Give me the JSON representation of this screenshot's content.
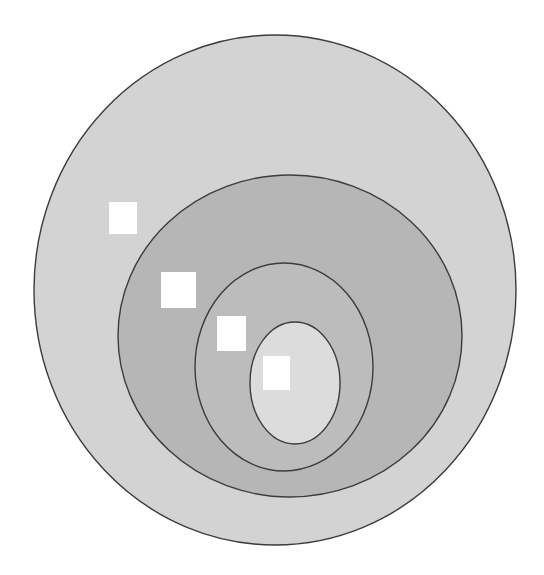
{
  "diagram": {
    "type": "nested-ellipses",
    "background": "#ffffff",
    "stroke_color": "#3c3c3c",
    "layers": [
      {
        "name": "outer-ellipse",
        "cx": 275,
        "cy": 290,
        "rx": 241,
        "ry": 255,
        "fill": "#d3d3d3"
      },
      {
        "name": "second-ellipse",
        "cx": 290,
        "cy": 336,
        "rx": 172,
        "ry": 161,
        "fill": "#b6b6b6"
      },
      {
        "name": "third-ellipse",
        "cx": 284,
        "cy": 367,
        "rx": 89,
        "ry": 104,
        "fill": "#bcbcbc"
      },
      {
        "name": "inner-ellipse",
        "cx": 295,
        "cy": 383,
        "rx": 45,
        "ry": 61,
        "fill": "#dcdcdc"
      }
    ],
    "markers": [
      {
        "name": "marker-outer",
        "x": 109,
        "y": 202,
        "w": 28,
        "h": 32,
        "fill": "#ffffff"
      },
      {
        "name": "marker-second",
        "x": 161,
        "y": 272,
        "w": 35,
        "h": 36,
        "fill": "#ffffff"
      },
      {
        "name": "marker-third",
        "x": 217,
        "y": 316,
        "w": 29,
        "h": 35,
        "fill": "#ffffff"
      },
      {
        "name": "marker-inner",
        "x": 263,
        "y": 356,
        "w": 27,
        "h": 34,
        "fill": "#ffffff"
      }
    ]
  }
}
